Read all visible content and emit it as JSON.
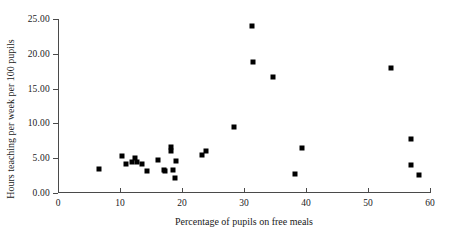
{
  "chart_data": {
    "type": "scatter",
    "title": "",
    "xlabel": "Percentage of pupils on free meals",
    "ylabel": "Hours teaching per week per 100 pupils",
    "xlim": [
      0,
      60
    ],
    "ylim": [
      0.0,
      25.0
    ],
    "grid": false,
    "legend": null,
    "x_ticks": [
      0,
      10,
      20,
      30,
      40,
      50,
      60
    ],
    "x_tick_labels": [
      "0",
      "10",
      "20",
      "30",
      "40",
      "50",
      "60"
    ],
    "y_ticks": [
      0.0,
      5.0,
      10.0,
      15.0,
      20.0,
      25.0
    ],
    "y_tick_labels": [
      "0.00",
      "5.00",
      "10.00",
      "15.00",
      "20.00",
      "25.00"
    ],
    "marker": "square",
    "marker_color": "#000000",
    "points": [
      {
        "x": 6.6,
        "y": 3.5
      },
      {
        "x": 10.3,
        "y": 5.3
      },
      {
        "x": 11.0,
        "y": 4.1
      },
      {
        "x": 11.9,
        "y": 4.4
      },
      {
        "x": 12.4,
        "y": 5.1
      },
      {
        "x": 12.8,
        "y": 4.4
      },
      {
        "x": 13.5,
        "y": 4.1
      },
      {
        "x": 14.4,
        "y": 3.2
      },
      {
        "x": 16.2,
        "y": 4.7
      },
      {
        "x": 17.1,
        "y": 3.3
      },
      {
        "x": 17.3,
        "y": 3.1
      },
      {
        "x": 18.2,
        "y": 6.6
      },
      {
        "x": 18.3,
        "y": 6.0
      },
      {
        "x": 18.6,
        "y": 3.3
      },
      {
        "x": 18.8,
        "y": 2.2
      },
      {
        "x": 19.1,
        "y": 4.6
      },
      {
        "x": 23.3,
        "y": 5.4
      },
      {
        "x": 23.9,
        "y": 6.1
      },
      {
        "x": 28.4,
        "y": 9.5
      },
      {
        "x": 31.3,
        "y": 24.0
      },
      {
        "x": 31.4,
        "y": 18.8
      },
      {
        "x": 34.7,
        "y": 16.7
      },
      {
        "x": 38.2,
        "y": 2.8
      },
      {
        "x": 39.4,
        "y": 6.5
      },
      {
        "x": 53.7,
        "y": 18.0
      },
      {
        "x": 57.0,
        "y": 7.8
      },
      {
        "x": 57.0,
        "y": 4.0
      },
      {
        "x": 58.2,
        "y": 2.6
      }
    ]
  }
}
